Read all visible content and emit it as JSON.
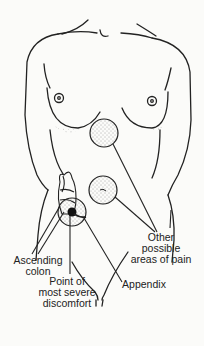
{
  "diagram": {
    "labels": {
      "ascending_colon": [
        "Ascending",
        "colon"
      ],
      "point_of_discomfort": [
        "Point of",
        "most severe",
        "discomfort"
      ],
      "appendix": [
        "Appendix"
      ],
      "other_areas": [
        "Other",
        "possible",
        "areas of pain"
      ]
    },
    "colors": {
      "ink": "#222222",
      "background": "#fbfbf9",
      "stipple": "#555555"
    }
  }
}
